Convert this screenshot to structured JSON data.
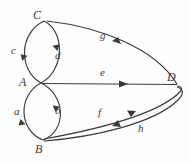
{
  "figure": {
    "kind": "directed-multigraph",
    "background_color": "#fdfdfd",
    "stroke_color": "#3a3a3a",
    "label_color": "#3a3a3a",
    "width": 190,
    "height": 163
  },
  "vertices": [
    {
      "id": "C",
      "label": "C",
      "x": 44,
      "y": 21,
      "label_x": 33,
      "label_y": 9
    },
    {
      "id": "A",
      "label": "A",
      "x": 41,
      "y": 83,
      "label_x": 19,
      "label_y": 76
    },
    {
      "id": "B",
      "label": "B",
      "x": 43,
      "y": 140,
      "label_x": 35,
      "label_y": 143
    },
    {
      "id": "D",
      "label": "D",
      "x": 177,
      "y": 85,
      "label_x": 167,
      "label_y": 71
    }
  ],
  "edges": [
    {
      "id": "c",
      "label": "c",
      "from": "A",
      "to": "C",
      "shape": "arc-left",
      "label_x": 11,
      "label_y": 45,
      "arrow_direction": "up"
    },
    {
      "id": "d",
      "label": "d",
      "from": "C",
      "to": "A",
      "shape": "arc-right",
      "label_x": 55,
      "label_y": 50,
      "arrow_direction": "down"
    },
    {
      "id": "a",
      "label": "a",
      "from": "A",
      "to": "B",
      "shape": "arc-left",
      "label_x": 14,
      "label_y": 106,
      "arrow_direction": "down"
    },
    {
      "id": "b",
      "label": "b",
      "from": "B",
      "to": "A",
      "shape": "arc-right",
      "label_x": 55,
      "label_y": 105,
      "arrow_direction": "up"
    },
    {
      "id": "g",
      "label": "g",
      "from": "D",
      "to": "C",
      "shape": "curve",
      "label_x": 100,
      "label_y": 30,
      "arrow_direction": "left"
    },
    {
      "id": "e",
      "label": "e",
      "from": "A",
      "to": "D",
      "shape": "straight",
      "label_x": 100,
      "label_y": 67,
      "arrow_direction": "right"
    },
    {
      "id": "f",
      "label": "f",
      "from": "B",
      "to": "D",
      "shape": "curve-upper",
      "label_x": 98,
      "label_y": 107,
      "arrow_direction": "right"
    },
    {
      "id": "h",
      "label": "h",
      "from": "D",
      "to": "B",
      "shape": "curve-lower",
      "label_x": 138,
      "label_y": 123,
      "arrow_direction": "left"
    }
  ]
}
